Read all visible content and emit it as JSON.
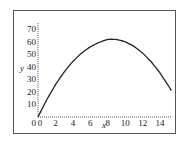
{
  "chart_data": {
    "type": "line",
    "title": "",
    "xlabel": "x",
    "ylabel": "y",
    "xlim": [
      0,
      15.3
    ],
    "ylim": [
      0,
      75
    ],
    "x_ticks": [
      "0",
      "2",
      "4",
      "6",
      "8",
      "10",
      "12",
      "14"
    ],
    "y_ticks": [
      "0",
      "10",
      "20",
      "30",
      "40",
      "50",
      "60",
      "70"
    ],
    "grid": false,
    "legend": null,
    "series": [
      {
        "name": "curve",
        "color": "#222222",
        "x": [
          0,
          1,
          2,
          3,
          4,
          5,
          6,
          7,
          8,
          8.5,
          9,
          10,
          11,
          12,
          13,
          14,
          15,
          15.3
        ],
        "y": [
          0,
          13.7,
          25.7,
          35.9,
          44.3,
          51.0,
          56.0,
          59.4,
          61.9,
          62.0,
          61.8,
          60.0,
          56.4,
          51.0,
          43.9,
          35.0,
          24.4,
          21.0
        ]
      }
    ]
  }
}
